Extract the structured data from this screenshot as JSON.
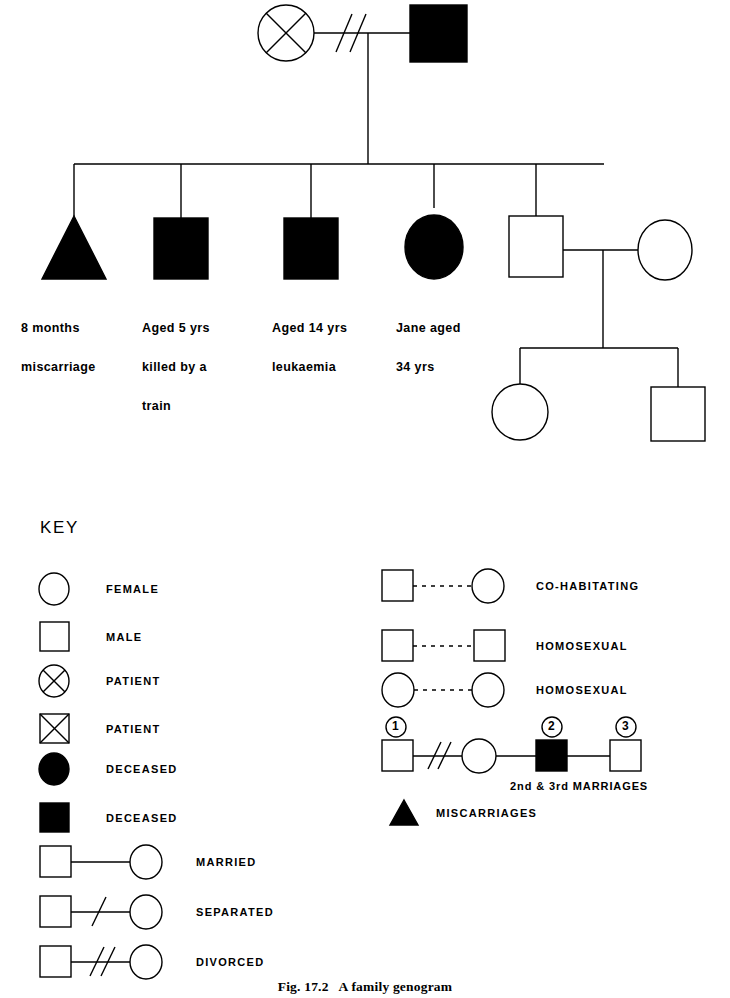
{
  "figure": {
    "caption": "Fig. 17.2   A family genogram",
    "background_color": "#ffffff",
    "ink_color": "#000000"
  },
  "genogram": {
    "generation1": {
      "mother": {
        "symbol": "circle-with-x",
        "role": "patient",
        "filled": false
      },
      "father": {
        "symbol": "square",
        "role": "deceased",
        "filled": true
      },
      "relationship": "divorced",
      "relationship_marks": 2
    },
    "generation2": [
      {
        "symbol": "triangle",
        "filled": true,
        "label_lines": [
          "8 months",
          "miscarriage"
        ]
      },
      {
        "symbol": "square",
        "filled": true,
        "label_lines": [
          "Aged 5 yrs",
          "killed by a",
          "train"
        ]
      },
      {
        "symbol": "square",
        "filled": true,
        "label_lines": [
          "Aged 14 yrs",
          "leukaemia"
        ]
      },
      {
        "symbol": "circle",
        "filled": true,
        "label_lines": [
          "Jane aged",
          "34 yrs"
        ]
      },
      {
        "symbol": "square",
        "filled": false,
        "label_lines": []
      }
    ],
    "generation2_spouse": {
      "symbol": "circle",
      "filled": false,
      "relationship": "married"
    },
    "generation3": [
      {
        "symbol": "circle",
        "filled": false
      },
      {
        "symbol": "square",
        "filled": false
      }
    ]
  },
  "key": {
    "title": "KEY",
    "left_column": [
      {
        "symbol": "circle",
        "label": "FEMALE"
      },
      {
        "symbol": "square",
        "label": "MALE"
      },
      {
        "symbol": "circle-with-x",
        "label": "PATIENT"
      },
      {
        "symbol": "square-with-x",
        "label": "PATIENT"
      },
      {
        "symbol": "circle-filled",
        "label": "DECEASED"
      },
      {
        "symbol": "square-filled",
        "label": "DECEASED"
      },
      {
        "symbol": "square-line-circle",
        "label": "MARRIED"
      },
      {
        "symbol": "square-slash-circle",
        "label": "SEPARATED"
      },
      {
        "symbol": "square-double-slash-circle",
        "label": "DIVORCED"
      }
    ],
    "right_column": [
      {
        "symbol": "square-dotted-circle",
        "label": "CO-HABITATING"
      },
      {
        "symbol": "square-dotted-square",
        "label": "HOMOSEXUAL"
      },
      {
        "symbol": "circle-dotted-circle",
        "label": "HOMOSEXUAL"
      }
    ],
    "marriages": {
      "numbers": [
        "1",
        "2",
        "3"
      ],
      "note": "2nd & 3rd MARRIAGES",
      "first_link": "divorced"
    },
    "miscarriages": {
      "symbol": "triangle-filled",
      "label": "MISCARRIAGES"
    }
  }
}
